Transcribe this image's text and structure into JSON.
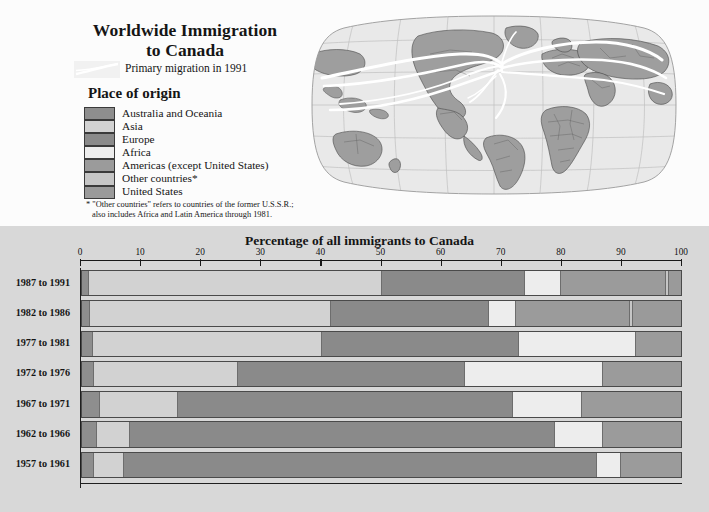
{
  "header": {
    "title_line1": "Worldwide Immigration",
    "title_line2": "to Canada",
    "primary_migration_label": "Primary migration in 1991",
    "legend_title": "Place of origin",
    "footnote_line1": "* \"Other countries\" refers to countries of the former U.S.S.R.;",
    "footnote_line2": "also includes Africa and Latin America through 1981."
  },
  "legend": {
    "items": [
      {
        "label": "Australia and Oceania",
        "color": "#8e8e8e"
      },
      {
        "label": "Asia",
        "color": "#d2d2d2"
      },
      {
        "label": "Europe",
        "color": "#8a8a8a"
      },
      {
        "label": "Africa",
        "color": "#ededed"
      },
      {
        "label": "Americas (except United States)",
        "color": "#9b9b9b"
      },
      {
        "label": "Other countries*",
        "color": "#c6c6c6"
      },
      {
        "label": "United States",
        "color": "#9a9a9a"
      }
    ]
  },
  "map": {
    "name": "world-robinson-projection",
    "land_color": "#9e9e9e",
    "ocean_color": "#e9e9e9",
    "flow_color": "#ffffff"
  },
  "chart_data": {
    "type": "bar",
    "orientation": "horizontal",
    "stacked": true,
    "title": "Percentage of all immigrants to Canada",
    "xlabel": "",
    "ylabel": "",
    "xlim": [
      0,
      100
    ],
    "xticks": [
      0,
      10,
      20,
      30,
      40,
      50,
      60,
      70,
      80,
      90,
      100
    ],
    "grid": false,
    "legend_position": "top-left-panel",
    "categories": [
      "1987 to 1991",
      "1982 to 1986",
      "1977 to 1981",
      "1972 to 1976",
      "1967 to 1971",
      "1962 to 1966",
      "1957 to 1961"
    ],
    "series": [
      {
        "name": "Australia and Oceania",
        "color": "#8e8e8e",
        "values": [
          1.2,
          1.3,
          1.8,
          2.0,
          3.0,
          2.5,
          2.0
        ]
      },
      {
        "name": "Asia",
        "color": "#d2d2d2",
        "values": [
          48.8,
          40.2,
          38.2,
          24.0,
          13.0,
          5.5,
          5.0
        ]
      },
      {
        "name": "Europe",
        "color": "#8a8a8a",
        "values": [
          24.0,
          26.5,
          33.0,
          38.0,
          56.0,
          71.0,
          79.0
        ]
      },
      {
        "name": "Africa",
        "color": "#ededed",
        "values": [
          6.0,
          4.5,
          19.5,
          23.0,
          11.5,
          8.0,
          4.0
        ]
      },
      {
        "name": "Americas (except United States)",
        "color": "#9b9b9b",
        "values": [
          17.5,
          19.0,
          7.5,
          13.0,
          16.5,
          13.0,
          10.0
        ]
      },
      {
        "name": "Other countries*",
        "color": "#c6c6c6",
        "values": [
          0.5,
          0.5,
          0.0,
          0.0,
          0.0,
          0.0,
          0.0
        ]
      },
      {
        "name": "United States",
        "color": "#9a9a9a",
        "values": [
          2.0,
          8.0,
          0.0,
          0.0,
          0.0,
          0.0,
          0.0
        ]
      }
    ]
  }
}
